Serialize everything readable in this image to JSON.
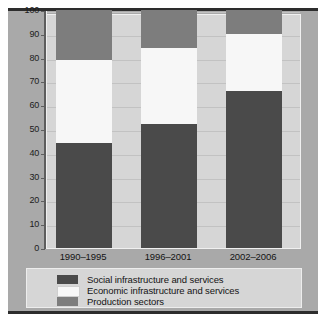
{
  "chart_data": {
    "type": "bar",
    "subtype": "stacked-100-percent",
    "title": "",
    "subtitle": "",
    "xlabel": "",
    "ylabel": "",
    "categories": [
      "1990–1995",
      "1996–2001",
      "2002–2006"
    ],
    "series": [
      {
        "name": "Social infrastructure and services",
        "color": "#4a4a4a",
        "values": [
          44,
          52,
          66
        ]
      },
      {
        "name": "Economic infrastructure and services",
        "color": "#f7f7f7",
        "values": [
          35,
          32,
          24
        ]
      },
      {
        "name": "Production sectors",
        "color": "#7d7d7d",
        "values": [
          21,
          16,
          10
        ]
      }
    ],
    "cumulative_tops": [
      {
        "category": "1990–1995",
        "social": 44,
        "social_plus_economic": 79,
        "total": 100
      },
      {
        "category": "1996–2001",
        "social": 52,
        "social_plus_economic": 84,
        "total": 100
      },
      {
        "category": "2002–2006",
        "social": 66,
        "social_plus_economic": 90,
        "total": 100
      }
    ],
    "ylim": [
      0,
      100
    ],
    "ytick_step": 10,
    "yticks": [
      0,
      10,
      20,
      30,
      40,
      50,
      60,
      70,
      80,
      90,
      100
    ],
    "ytick_labels": [
      "0",
      "10",
      "20",
      "30",
      "40",
      "50",
      "60",
      "70",
      "80",
      "90",
      "100"
    ],
    "grid": true,
    "grid_axis": "y",
    "legend_position": "bottom",
    "legend_entries": [
      "Social infrastructure and services",
      "Economic infrastructure and services",
      "Production sectors"
    ]
  },
  "axes": {
    "y": {
      "ticks": [
        {
          "value": 100,
          "label": "100"
        },
        {
          "value": 90,
          "label": "90"
        },
        {
          "value": 80,
          "label": "80"
        },
        {
          "value": 70,
          "label": "70"
        },
        {
          "value": 60,
          "label": "60"
        },
        {
          "value": 50,
          "label": "50"
        },
        {
          "value": 40,
          "label": "40"
        },
        {
          "value": 30,
          "label": "30"
        },
        {
          "value": 20,
          "label": "20"
        },
        {
          "value": 10,
          "label": "10"
        },
        {
          "value": 0,
          "label": "0"
        }
      ]
    },
    "x": {
      "ticks": [
        {
          "label": "1990–1995"
        },
        {
          "label": "1996–2001"
        },
        {
          "label": "2002–2006"
        }
      ]
    }
  },
  "legend": {
    "items": [
      {
        "label": "Social infrastructure and services",
        "color": "#4a4a4a"
      },
      {
        "label": "Economic infrastructure and services",
        "color": "#f7f7f7"
      },
      {
        "label": "Production sectors",
        "color": "#7d7d7d"
      }
    ]
  },
  "colors": {
    "social": "#4a4a4a",
    "economic": "#f7f7f7",
    "production": "#7d7d7d",
    "plot_background": "#d6d6d6",
    "figure_background": "#a9a9a9",
    "rule": "#2d2d2d",
    "gridline": "#c2c2c2",
    "axis": "#5d5d5d",
    "text": "#141414"
  }
}
